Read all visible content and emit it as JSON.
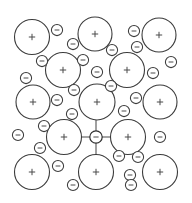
{
  "diagram": {
    "canvas": {
      "width": 192,
      "height": 203,
      "background": "#ffffff"
    },
    "colors": {
      "stroke": "#3c3c3c",
      "bond": "#4a4a4a",
      "fill": "#ffffff",
      "sign": "#4a4a4a"
    },
    "legend": {
      "positive_symbol": "+",
      "negative_symbol": "−",
      "positive_label": "positive ion",
      "negative_label": "negative ion"
    },
    "radii": {
      "large": 17.5,
      "small": 5.6,
      "center": 6.2
    },
    "positive_ions": [
      {
        "cx": 32,
        "cy": 37,
        "r": 17.5,
        "charge": "+"
      },
      {
        "cx": 95,
        "cy": 34,
        "r": 17.0,
        "charge": "+"
      },
      {
        "cx": 159,
        "cy": 35,
        "r": 17.0,
        "charge": "+"
      },
      {
        "cx": 63,
        "cy": 70,
        "r": 17.5,
        "charge": "+"
      },
      {
        "cx": 127,
        "cy": 70,
        "r": 17.5,
        "charge": "+"
      },
      {
        "cx": 33,
        "cy": 102,
        "r": 17.0,
        "charge": "+"
      },
      {
        "cx": 97,
        "cy": 102,
        "r": 18.0,
        "charge": "+"
      },
      {
        "cx": 160,
        "cy": 102,
        "r": 17.0,
        "charge": "+"
      },
      {
        "cx": 64,
        "cy": 137,
        "r": 17.5,
        "charge": "+"
      },
      {
        "cx": 128,
        "cy": 137,
        "r": 17.5,
        "charge": "+"
      },
      {
        "cx": 32,
        "cy": 172,
        "r": 17.5,
        "charge": "+"
      },
      {
        "cx": 96,
        "cy": 172,
        "r": 17.5,
        "charge": "+"
      },
      {
        "cx": 160,
        "cy": 172,
        "r": 17.5,
        "charge": "+"
      }
    ],
    "negative_ions": [
      {
        "cx": 57,
        "cy": 30,
        "r": 5.6,
        "charge": "−"
      },
      {
        "cx": 134,
        "cy": 31,
        "r": 5.6,
        "charge": "−"
      },
      {
        "cx": 73,
        "cy": 44,
        "r": 5.6,
        "charge": "−"
      },
      {
        "cx": 137,
        "cy": 47,
        "r": 5.6,
        "charge": "−"
      },
      {
        "cx": 112,
        "cy": 50,
        "r": 5.6,
        "charge": "−"
      },
      {
        "cx": 42,
        "cy": 61,
        "r": 5.6,
        "charge": "−"
      },
      {
        "cx": 83,
        "cy": 60,
        "r": 5.6,
        "charge": "−"
      },
      {
        "cx": 171,
        "cy": 62,
        "r": 5.6,
        "charge": "−"
      },
      {
        "cx": 26,
        "cy": 78,
        "r": 5.6,
        "charge": "−"
      },
      {
        "cx": 97,
        "cy": 72,
        "r": 5.6,
        "charge": "−"
      },
      {
        "cx": 153,
        "cy": 73,
        "r": 5.6,
        "charge": "−"
      },
      {
        "cx": 111,
        "cy": 86,
        "r": 5.6,
        "charge": "−"
      },
      {
        "cx": 74,
        "cy": 90,
        "r": 5.6,
        "charge": "−"
      },
      {
        "cx": 57,
        "cy": 100,
        "r": 5.6,
        "charge": "−"
      },
      {
        "cx": 136,
        "cy": 98,
        "r": 5.6,
        "charge": "−"
      },
      {
        "cx": 72,
        "cy": 114,
        "r": 5.6,
        "charge": "−"
      },
      {
        "cx": 124,
        "cy": 111,
        "r": 5.6,
        "charge": "−"
      },
      {
        "cx": 44,
        "cy": 126,
        "r": 5.6,
        "charge": "−"
      },
      {
        "cx": 18,
        "cy": 135,
        "r": 5.6,
        "charge": "−"
      },
      {
        "cx": 160,
        "cy": 137,
        "r": 5.6,
        "charge": "−"
      },
      {
        "cx": 40,
        "cy": 148,
        "r": 5.6,
        "charge": "−"
      },
      {
        "cx": 119,
        "cy": 156,
        "r": 5.6,
        "charge": "−"
      },
      {
        "cx": 138,
        "cy": 157,
        "r": 5.6,
        "charge": "−"
      },
      {
        "cx": 58,
        "cy": 166,
        "r": 5.6,
        "charge": "−"
      },
      {
        "cx": 130,
        "cy": 175,
        "r": 5.6,
        "charge": "−"
      },
      {
        "cx": 73,
        "cy": 185,
        "r": 5.6,
        "charge": "−"
      },
      {
        "cx": 131,
        "cy": 185,
        "r": 5.6,
        "charge": "−"
      }
    ],
    "center_ion": {
      "cx": 96,
      "cy": 137,
      "r": 6.2,
      "charge": "−"
    },
    "bonds": [
      {
        "x1": 51,
        "y1": 137,
        "x2": 90,
        "y2": 137,
        "to": "left-positive-ion"
      },
      {
        "x1": 102,
        "y1": 137,
        "x2": 141,
        "y2": 137,
        "to": "right-positive-ion"
      },
      {
        "x1": 96,
        "y1": 120,
        "x2": 96,
        "y2": 131,
        "to": "upper-positive-ion"
      },
      {
        "x1": 96,
        "y1": 143,
        "x2": 96,
        "y2": 155,
        "to": "lower-positive-ion"
      }
    ]
  }
}
